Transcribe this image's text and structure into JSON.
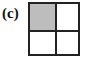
{
  "figure": {
    "label": "(c)",
    "grid": {
      "rows": 2,
      "cols": 2,
      "cells": [
        {
          "row": 0,
          "col": 0,
          "shaded": true,
          "color": "#bdbdbd"
        },
        {
          "row": 0,
          "col": 1,
          "shaded": false,
          "color": "#ffffff"
        },
        {
          "row": 1,
          "col": 0,
          "shaded": false,
          "color": "#ffffff"
        },
        {
          "row": 1,
          "col": 1,
          "shaded": false,
          "color": "#ffffff"
        }
      ],
      "line_color": "#222222"
    }
  }
}
